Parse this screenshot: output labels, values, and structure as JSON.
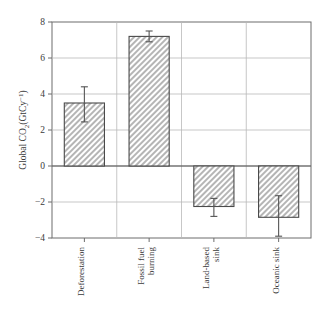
{
  "figure": {
    "background_color": "#ffffff",
    "frame_color": "#6d6d6d",
    "grid_color": "#b9b9b9",
    "bar_edge_color": "#4a4a4a",
    "bar_fill_color": "#c9c9c9",
    "error_bar_color": "#555555"
  },
  "chart_data": {
    "type": "bar",
    "title": "",
    "xlabel": "",
    "ylabel": "Global CO2(GtCy-1)",
    "ylabel_parts": {
      "lead": "Global CO",
      "sub": "2",
      "mid": "(GtCy",
      "sup": "−1",
      "tail": ")"
    },
    "categories": [
      "Deforestation",
      "Fossil fuel burning",
      "Land-based sink",
      "Oceanic sink"
    ],
    "category_lines": [
      [
        "Deforestation"
      ],
      [
        "Fossil fuel",
        "burning"
      ],
      [
        "Land-based",
        "sink"
      ],
      [
        "Oceanic sink"
      ]
    ],
    "values": [
      3.5,
      7.2,
      -2.25,
      -2.85
    ],
    "error_low": [
      2.45,
      6.9,
      -2.8,
      -3.9
    ],
    "error_high": [
      4.4,
      7.5,
      -1.8,
      -1.65
    ],
    "ylim": [
      -4,
      8
    ],
    "yticks": [
      8,
      6,
      4,
      2,
      0,
      -2,
      -4
    ],
    "ytick_labels": [
      "8",
      "6",
      "4",
      "2",
      "0",
      "−2",
      "−4"
    ],
    "grid": true,
    "grid_axis": "y",
    "legend": null,
    "legend_position": "none",
    "bar_hatch": "diagonal-crosshatch",
    "annotations": []
  }
}
